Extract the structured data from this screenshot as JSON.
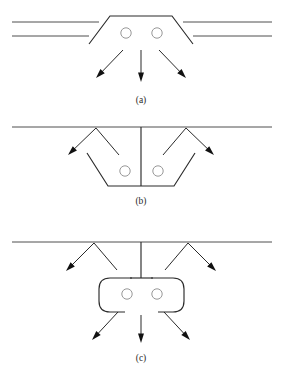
{
  "figure": {
    "width": 283,
    "height": 376,
    "background": "#ffffff",
    "line_color": "#2b2b2b",
    "ground_color": "#3a3a3a",
    "arrow_color": "#111111",
    "hole_color": "#8c8c8c",
    "caption_color": "#2a2a2a",
    "type": "technical-line-diagram",
    "panel_count": 3
  },
  "panels": [
    {
      "id": "a",
      "caption": "(a)",
      "caption_x": 141,
      "caption_y": 103,
      "description": "raised trapezoid above two parallel horizontal lines with two holes and three downward arrows",
      "ground_lines": [
        {
          "name": "upper-ground-line-left",
          "x1": 12,
          "y1": 22,
          "x2": 99,
          "y2": 22
        },
        {
          "name": "upper-ground-line-right",
          "x1": 183,
          "y1": 22,
          "x2": 272,
          "y2": 22
        },
        {
          "name": "lower-ground-line-left",
          "x1": 12,
          "y1": 36,
          "x2": 89,
          "y2": 36
        },
        {
          "name": "lower-ground-line-right",
          "x1": 193,
          "y1": 36,
          "x2": 272,
          "y2": 36
        }
      ],
      "body_path": "M 89 44 L 110 16 L 172 16 L 193 44",
      "holes": [
        {
          "name": "hole-left",
          "cx": 126,
          "cy": 33,
          "r": 5.2
        },
        {
          "name": "hole-right",
          "cx": 157,
          "cy": 33,
          "r": 5.2
        }
      ],
      "arrows": [
        {
          "name": "arrow-down-left",
          "x1": 123,
          "y1": 50,
          "x2": 96,
          "y2": 78
        },
        {
          "name": "arrow-down-center",
          "x1": 141,
          "y1": 50,
          "x2": 141,
          "y2": 82
        },
        {
          "name": "arrow-down-right",
          "x1": 159,
          "y1": 50,
          "x2": 186,
          "y2": 78
        }
      ]
    },
    {
      "id": "b",
      "caption": "(b)",
      "caption_x": 141,
      "caption_y": 204,
      "description": "inverted trapezoid recess below a single ground line, two holes, central post, and two V-shaped arrow pairs",
      "ground_lines": [
        {
          "name": "ground-line",
          "x1": 12,
          "y1": 127,
          "x2": 272,
          "y2": 127
        }
      ],
      "body_path": "M 87 153 L 108 186 L 174 186 L 195 153",
      "center_post": {
        "name": "center-post",
        "x1": 141,
        "y1": 127,
        "x2": 141,
        "y2": 186
      },
      "holes": [
        {
          "name": "hole-left",
          "cx": 125,
          "cy": 171,
          "r": 5.2
        },
        {
          "name": "hole-right",
          "cx": 158,
          "cy": 171,
          "r": 5.2
        }
      ],
      "vee_arrows": [
        {
          "name": "vee-left",
          "apex": {
            "x": 96,
            "y": 128
          },
          "arrow_branch": {
            "x1": 96,
            "y1": 128,
            "x2": 68,
            "y2": 155
          },
          "plain_branch": {
            "x1": 96,
            "y1": 128,
            "x2": 119,
            "y2": 155
          }
        },
        {
          "name": "vee-right",
          "apex": {
            "x": 186,
            "y": 128
          },
          "arrow_branch": {
            "x1": 186,
            "y1": 128,
            "x2": 214,
            "y2": 155
          },
          "plain_branch": {
            "x1": 186,
            "y1": 128,
            "x2": 163,
            "y2": 155
          }
        }
      ]
    },
    {
      "id": "c",
      "caption": "(c)",
      "caption_x": 141,
      "caption_y": 361,
      "description": "rounded capsule body with top gap, T-shaped stem to ground line, two holes, two V-shaped arrow pairs above and three arrows below",
      "ground_lines": [
        {
          "name": "ground-line",
          "x1": 12,
          "y1": 242,
          "x2": 272,
          "y2": 242
        }
      ],
      "capsule": {
        "name": "capsule-body",
        "left_path": "M 132 278 L 110 278 Q 99 278 99 289 L 99 301 Q 99 312 110 312 L 125 312",
        "right_path": "M 151 278 L 173 278 Q 184 278 184 289 L 184 301 Q 184 312 173 312 L 158 312"
      },
      "stem": {
        "name": "center-stem",
        "vertical": {
          "x1": 141,
          "y1": 242,
          "x2": 141,
          "y2": 278
        },
        "crossbar": {
          "x1": 130,
          "y1": 278,
          "x2": 153,
          "y2": 278
        }
      },
      "holes": [
        {
          "name": "hole-left",
          "cx": 127,
          "cy": 294,
          "r": 5.2
        },
        {
          "name": "hole-right",
          "cx": 157,
          "cy": 294,
          "r": 5.2
        }
      ],
      "vee_arrows": [
        {
          "name": "vee-left",
          "apex": {
            "x": 94,
            "y": 243
          },
          "arrow_branch": {
            "x1": 94,
            "y1": 243,
            "x2": 66,
            "y2": 271
          },
          "plain_branch": {
            "x1": 94,
            "y1": 243,
            "x2": 117,
            "y2": 270
          }
        },
        {
          "name": "vee-right",
          "apex": {
            "x": 188,
            "y": 243
          },
          "arrow_branch": {
            "x1": 188,
            "y1": 243,
            "x2": 216,
            "y2": 271
          },
          "plain_branch": {
            "x1": 188,
            "y1": 243,
            "x2": 165,
            "y2": 270
          }
        }
      ],
      "arrows": [
        {
          "name": "arrow-down-left",
          "x1": 118,
          "y1": 312,
          "x2": 92,
          "y2": 340
        },
        {
          "name": "arrow-down-center",
          "x1": 141,
          "y1": 315,
          "x2": 141,
          "y2": 343
        },
        {
          "name": "arrow-down-right",
          "x1": 164,
          "y1": 312,
          "x2": 190,
          "y2": 340
        }
      ]
    }
  ]
}
